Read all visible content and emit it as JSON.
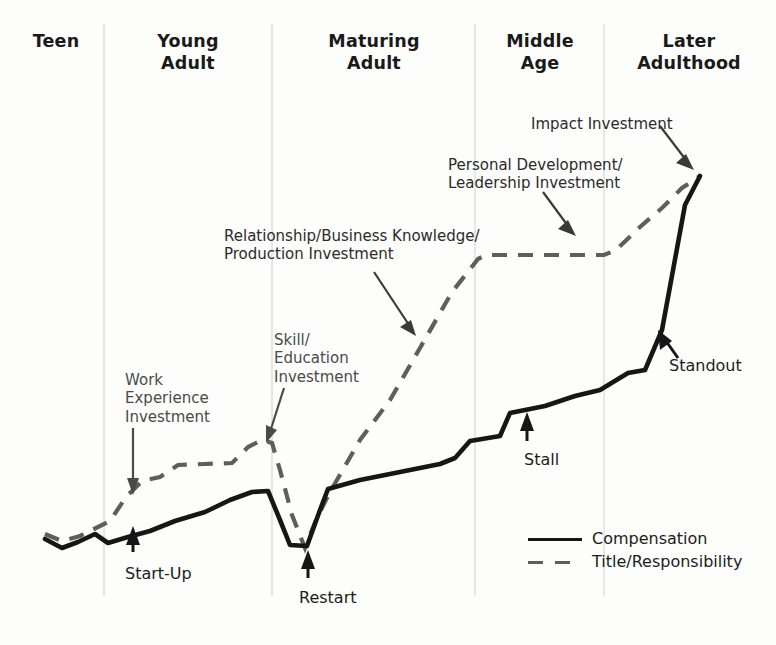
{
  "chart_data": {
    "type": "line",
    "title": "",
    "xlabel": "Life Stage",
    "ylabel": "Relative Level",
    "grid": false,
    "legend_position": "bottom-right",
    "axis_note": "Conceptual career curve; axes unlabeled and unscaled.",
    "stages": [
      {
        "name": "Teen",
        "x_start": 0,
        "x_end": 104
      },
      {
        "name": "Young\nAdult",
        "x_start": 104,
        "x_end": 272
      },
      {
        "name": "Maturing\nAdult",
        "x_start": 272,
        "x_end": 475
      },
      {
        "name": "Middle\nAge",
        "x_start": 475,
        "x_end": 604
      },
      {
        "name": "Later\nAdulthood",
        "x_start": 604,
        "x_end": 776
      }
    ],
    "dividers_x": [
      104,
      272,
      475,
      604
    ],
    "series": [
      {
        "name": "Compensation",
        "style": "solid",
        "color": "#161616",
        "points": "45,539 62,548 78,542 95,534 108,543 128,537 150,531 175,521 205,512 230,500 252,492 268,491 280,520 290,545 307,546 320,510 328,489 360,480 400,472 440,464 455,458 470,441 500,436 510,413 545,406 575,396 600,390 628,373 645,370 662,330 685,205 700,176"
      },
      {
        "name": "Title/Responsibility",
        "style": "dashed",
        "color": "#5e5e5e",
        "points": "45,534 62,541 80,536 96,528 110,521 126,497 142,481 160,477 178,465 205,464 232,463 248,447 262,440 272,443 280,470 292,515 305,548 316,520 330,492 360,440 390,400 420,348 452,292 478,259 486,255 540,255 580,255 604,255 616,250 640,227 662,208 682,188 700,176"
      }
    ],
    "annotations": [
      {
        "id": "work-experience-investment",
        "text": "Work\nExperience\nInvestment",
        "x": 125,
        "y": 371
      },
      {
        "id": "skill-education-investment",
        "text": "Skill/\nEducation\nInvestment",
        "x": 274,
        "y": 331
      },
      {
        "id": "relationship-business-knowledge-production-investment",
        "text": "Relationship/Business Knowledge/\nProduction Investment",
        "x": 224,
        "y": 227
      },
      {
        "id": "personal-development-leadership-investment",
        "text": "Personal Development/\nLeadership Investment",
        "x": 448,
        "y": 156
      },
      {
        "id": "impact-investment",
        "text": "Impact Investment",
        "x": 531,
        "y": 115
      }
    ],
    "milestones": [
      {
        "id": "start-up",
        "text": "Start-Up",
        "x": 125,
        "y": 564
      },
      {
        "id": "restart",
        "text": "Restart",
        "x": 299,
        "y": 588
      },
      {
        "id": "stall",
        "text": "Stall",
        "x": 524,
        "y": 450
      },
      {
        "id": "standout",
        "text": "Standout",
        "x": 669,
        "y": 356
      }
    ],
    "legend": [
      {
        "label": "Compensation",
        "style": "solid"
      },
      {
        "label": "Title/Responsibility",
        "style": "dashed"
      }
    ]
  },
  "colors": {
    "background": "#fdfdfb",
    "compensation_line": "#161616",
    "title_line": "#5e5e5e",
    "divider": "#d8d8d4",
    "header_text": "#1a1a1a",
    "annotation_text": "#4a4a4a",
    "milestone_text": "#1c1c1c"
  }
}
